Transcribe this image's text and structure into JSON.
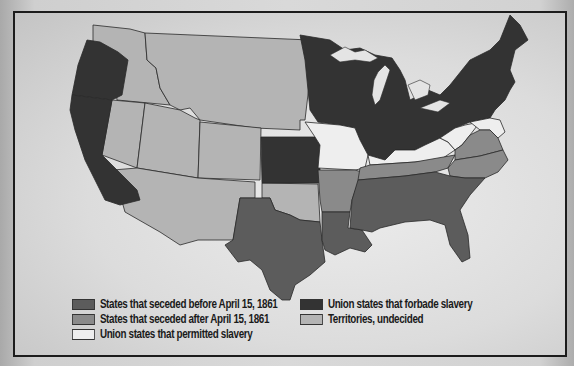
{
  "map": {
    "subject": "United States at the outbreak of the Civil War",
    "colors": {
      "seceded_before": "#5c5c5c",
      "seceded_after": "#8a8a8a",
      "union_slave": "#eeeeee",
      "union_free": "#333333",
      "territories": "#b4b4b4",
      "border": "#2a2a2a",
      "water": "#e2e2e2"
    }
  },
  "legend": {
    "items": [
      {
        "label": "States that seceded before April 15, 1861",
        "color": "#5c5c5c"
      },
      {
        "label": "States that seceded after April 15, 1861",
        "color": "#8a8a8a"
      },
      {
        "label": "Union states that permitted slavery",
        "color": "#eeeeee"
      },
      {
        "label": "Union states that forbade slavery",
        "color": "#333333"
      },
      {
        "label": "Territories, undecided",
        "color": "#b4b4b4"
      }
    ]
  }
}
